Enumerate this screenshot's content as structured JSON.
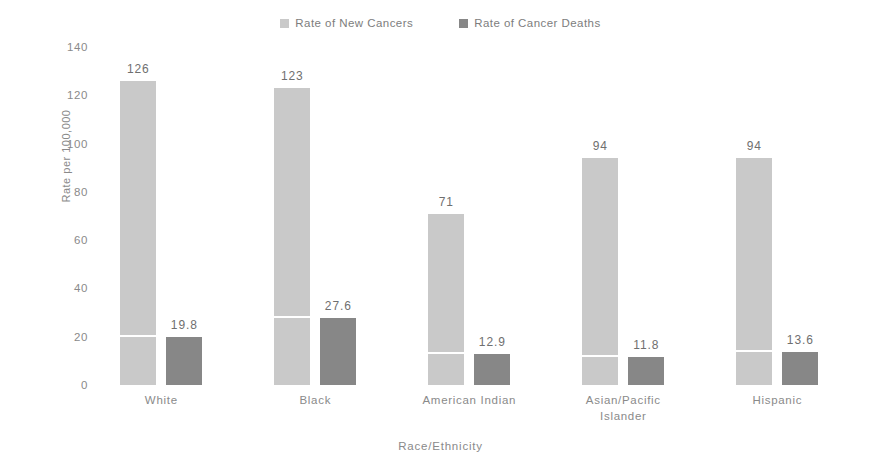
{
  "chart_data": {
    "type": "bar",
    "title": "",
    "xlabel": "Race/Ethnicity",
    "ylabel": "Rate per 100,000",
    "ylim": [
      0,
      140
    ],
    "yticks": [
      0,
      20,
      40,
      60,
      80,
      100,
      120,
      140
    ],
    "grid": false,
    "legend_position": "top-center",
    "categories": [
      "White",
      "Black",
      "American Indian",
      "Asian/Pacific Islander",
      "Hispanic"
    ],
    "category_lines": [
      [
        "White"
      ],
      [
        "Black"
      ],
      [
        "American Indian"
      ],
      [
        "Asian/Pacific",
        "Islander"
      ],
      [
        "Hispanic"
      ]
    ],
    "series": [
      {
        "name": "Rate of New Cancers",
        "color": "#c9c9c9",
        "values": [
          126,
          123,
          71,
          94,
          94
        ],
        "labels": [
          "126",
          "123",
          "71",
          "94",
          "94"
        ]
      },
      {
        "name": "Rate of Cancer Deaths",
        "color": "#878787",
        "values": [
          19.8,
          27.6,
          12.9,
          11.8,
          13.6
        ],
        "labels": [
          "19.8",
          "27.6",
          "12.9",
          "11.8",
          "13.6"
        ]
      }
    ]
  },
  "legend": {
    "items": [
      {
        "label": "Rate of New Cancers",
        "color": "#c9c9c9"
      },
      {
        "label": "Rate of Cancer Deaths",
        "color": "#878787"
      }
    ]
  },
  "axes": {
    "y_title": "Rate per 100,000",
    "x_title": "Race/Ethnicity",
    "y_ticks": [
      "140",
      "120",
      "100",
      "80",
      "60",
      "40",
      "20",
      "0"
    ]
  }
}
